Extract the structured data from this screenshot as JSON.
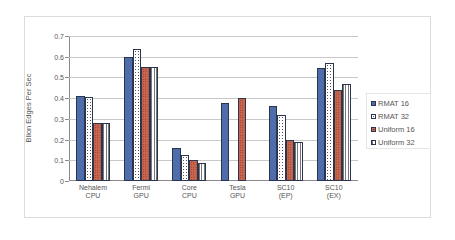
{
  "chart_data": {
    "type": "bar",
    "title": "",
    "xlabel": "",
    "ylabel": "Blion Edges Per Sec",
    "ylim": [
      0,
      0.7
    ],
    "yticks": [
      "0",
      "0.1",
      "0.2",
      "0.3",
      "0.4",
      "0.5",
      "0.6",
      "0.7"
    ],
    "grid": true,
    "legend_position": "right",
    "categories": [
      "Nehalem CPU",
      "Fermi GPU",
      "Core CPU",
      "Tesla GPU",
      "SC10 (EP)",
      "SC10 (EX)"
    ],
    "category_lines": [
      [
        "Nehalem",
        "CPU"
      ],
      [
        "Fermi",
        "GPU"
      ],
      [
        "Core",
        "CPU"
      ],
      [
        "Tesla",
        "GPU"
      ],
      [
        "SC10",
        "(EP)"
      ],
      [
        "SC10",
        "(EX)"
      ]
    ],
    "series": [
      {
        "name": "RMAT 16",
        "values": [
          0.41,
          0.6,
          0.16,
          0.375,
          0.36,
          0.545
        ]
      },
      {
        "name": "RMAT 32",
        "values": [
          0.405,
          0.635,
          0.125,
          null,
          0.32,
          0.57
        ]
      },
      {
        "name": "Uniform 16",
        "values": [
          0.28,
          0.55,
          0.1,
          0.4,
          0.2,
          0.44
        ]
      },
      {
        "name": "Uniform 32",
        "values": [
          0.28,
          0.55,
          0.085,
          null,
          0.19,
          0.47
        ]
      }
    ]
  },
  "colors": {
    "rmat16": "#4f6daa",
    "uniform16": "#c9664d"
  }
}
